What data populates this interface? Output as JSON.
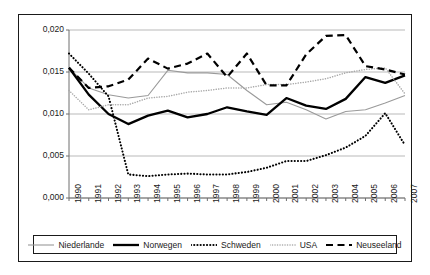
{
  "chart_data": {
    "type": "line",
    "title": "",
    "subtitle": "",
    "xlabel": "",
    "ylabel": "",
    "xlim": [
      1990,
      2007
    ],
    "ylim": [
      0.0,
      0.02
    ],
    "grid": true,
    "legend_position": "bottom",
    "y_ticks": [
      "0,000",
      "0,005",
      "0,010",
      "0,015",
      "0,020"
    ],
    "y_tick_values": [
      0.0,
      0.005,
      0.01,
      0.015,
      0.02
    ],
    "categories": [
      "1990",
      "1991",
      "1992",
      "1993",
      "1994",
      "1995",
      "1996",
      "1997",
      "1998",
      "1999",
      "2000",
      "2001",
      "2002",
      "2003",
      "2004",
      "2005",
      "2006",
      "2007"
    ],
    "x": [
      1990,
      1991,
      1992,
      1993,
      1994,
      1995,
      1996,
      1997,
      1998,
      1999,
      2000,
      2001,
      2002,
      2003,
      2004,
      2005,
      2006,
      2007
    ],
    "series": [
      {
        "name": "Niederlande",
        "style": "solid-thin-gray",
        "color": "#9a9a9a",
        "values": [
          0.0155,
          0.0131,
          0.0123,
          0.0119,
          0.0122,
          0.0152,
          0.0149,
          0.0149,
          0.0147,
          0.0128,
          0.0111,
          0.0114,
          0.0105,
          0.0094,
          0.0103,
          0.0105,
          0.0113,
          0.0122
        ]
      },
      {
        "name": "Norwegen",
        "style": "solid-thick-black",
        "color": "#000000",
        "values": [
          0.0155,
          0.0123,
          0.01,
          0.0088,
          0.0098,
          0.0104,
          0.0096,
          0.01,
          0.0108,
          0.0103,
          0.0099,
          0.0119,
          0.011,
          0.0106,
          0.0118,
          0.0144,
          0.0137,
          0.0146
        ]
      },
      {
        "name": "Schweden",
        "style": "dotted-thick-black",
        "color": "#000000",
        "values": [
          0.0172,
          0.0148,
          0.0121,
          0.0028,
          0.0026,
          0.0028,
          0.0029,
          0.0028,
          0.0028,
          0.0031,
          0.0036,
          0.0044,
          0.0044,
          0.0051,
          0.006,
          0.0074,
          0.0101,
          0.0063
        ]
      },
      {
        "name": "USA",
        "style": "dotted-fine-gray",
        "color": "#a8a8a8",
        "values": [
          0.0128,
          0.0105,
          0.0111,
          0.0111,
          0.0119,
          0.0121,
          0.0126,
          0.0128,
          0.0131,
          0.0131,
          0.0135,
          0.0135,
          0.0138,
          0.0142,
          0.0149,
          0.0153,
          0.0155,
          0.0124
        ]
      },
      {
        "name": "Neuseeland",
        "style": "dashed-black",
        "color": "#000000",
        "values": [
          0.0155,
          0.0131,
          0.0133,
          0.0141,
          0.0166,
          0.0154,
          0.016,
          0.0172,
          0.0144,
          0.0172,
          0.0134,
          0.0134,
          0.0171,
          0.0193,
          0.0194,
          0.0157,
          0.0153,
          0.0147
        ]
      }
    ]
  },
  "legend": {
    "items": [
      {
        "label": "Niederlande"
      },
      {
        "label": "Norwegen"
      },
      {
        "label": "Schweden"
      },
      {
        "label": "USA"
      },
      {
        "label": "Neuseeland"
      }
    ]
  }
}
